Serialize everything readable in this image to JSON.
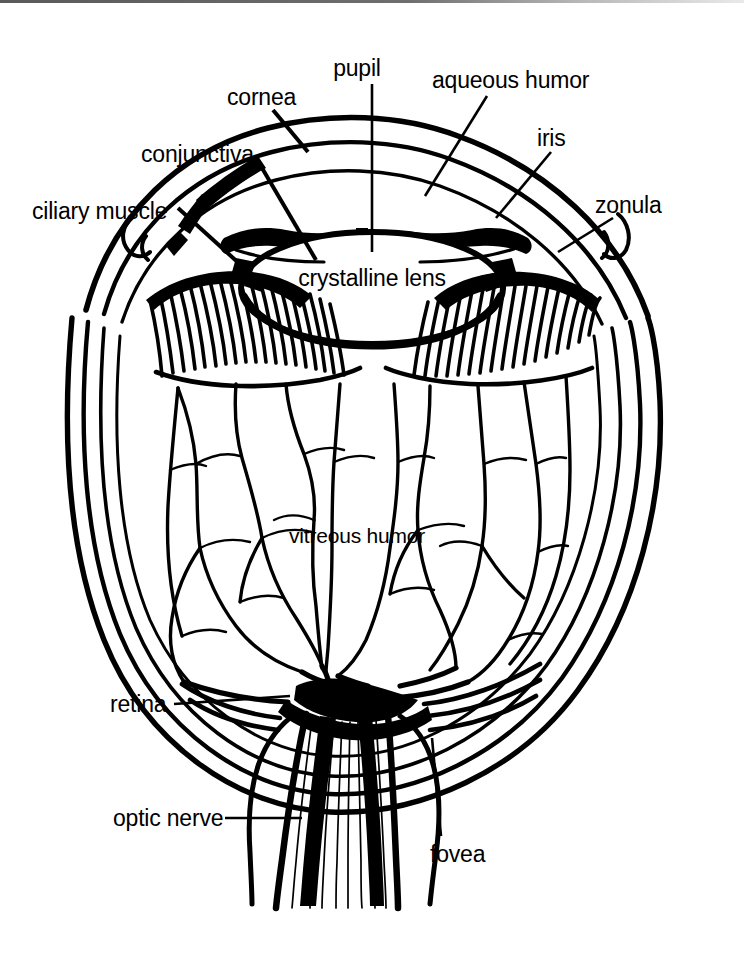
{
  "figure": {
    "type": "anatomical-line-diagram",
    "width": 744,
    "height": 970,
    "ink_color": "#000000",
    "background_color": "#ffffff",
    "scan_edge_color": "#6e6e6e"
  },
  "labels": {
    "pupil": "pupil",
    "aqueous_humor": "aqueous humor",
    "cornea": "cornea",
    "iris": "iris",
    "conjunctiva": "conjunctiva",
    "zonula": "zonula",
    "ciliary_muscle": "ciliary muscle",
    "crystalline_lens": "crystalline lens",
    "vitreous_humor": "vitreous humor",
    "retina": "retina",
    "optic_nerve": "optic nerve",
    "fovea": "fovea"
  },
  "label_list": [
    {
      "key": "pupil",
      "text": "pupil",
      "has_leader": true
    },
    {
      "key": "aqueous_humor",
      "text": "aqueous humor",
      "has_leader": true
    },
    {
      "key": "cornea",
      "text": "cornea",
      "has_leader": true
    },
    {
      "key": "iris",
      "text": "iris",
      "has_leader": true
    },
    {
      "key": "conjunctiva",
      "text": "conjunctiva",
      "has_leader": true
    },
    {
      "key": "zonula",
      "text": "zonula",
      "has_leader": true
    },
    {
      "key": "ciliary_muscle",
      "text": "ciliary muscle",
      "has_leader": true
    },
    {
      "key": "crystalline_lens",
      "text": "crystalline lens",
      "has_leader": false
    },
    {
      "key": "vitreous_humor",
      "text": "vitreous humor",
      "has_leader": false
    },
    {
      "key": "retina",
      "text": "retina",
      "has_leader": true
    },
    {
      "key": "optic_nerve",
      "text": "optic nerve",
      "has_leader": true
    },
    {
      "key": "fovea",
      "text": "fovea",
      "has_leader": true
    }
  ]
}
